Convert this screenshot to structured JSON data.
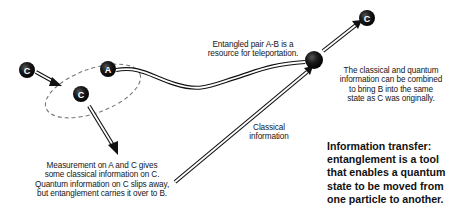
{
  "particles": {
    "c_incoming": "C",
    "a": "A",
    "c_measured": "C",
    "b": "",
    "c_result": "C"
  },
  "labels": {
    "entangled_pair": [
      "Entangled pair A-B is a",
      "resource for teleportation."
    ],
    "combined": [
      "The classical and quantum",
      "information can be combined",
      "to bring B into the same",
      "state as C was originally."
    ],
    "classical_information": [
      "Classical",
      "information"
    ],
    "measurement": [
      "Measurement on A and C gives",
      "some classical information on C.",
      "Quantum information on C slips away,",
      "but entanglement carries it over to B."
    ]
  },
  "caption": {
    "lines": [
      "Information transfer:",
      "entanglement is a tool",
      "that enables a quantum",
      "state to be moved from",
      "one particle to another."
    ]
  },
  "colors": {
    "ball": "#111111",
    "arrow": "#111111",
    "dashed_ellipse": "#777777",
    "background": "#ffffff"
  }
}
